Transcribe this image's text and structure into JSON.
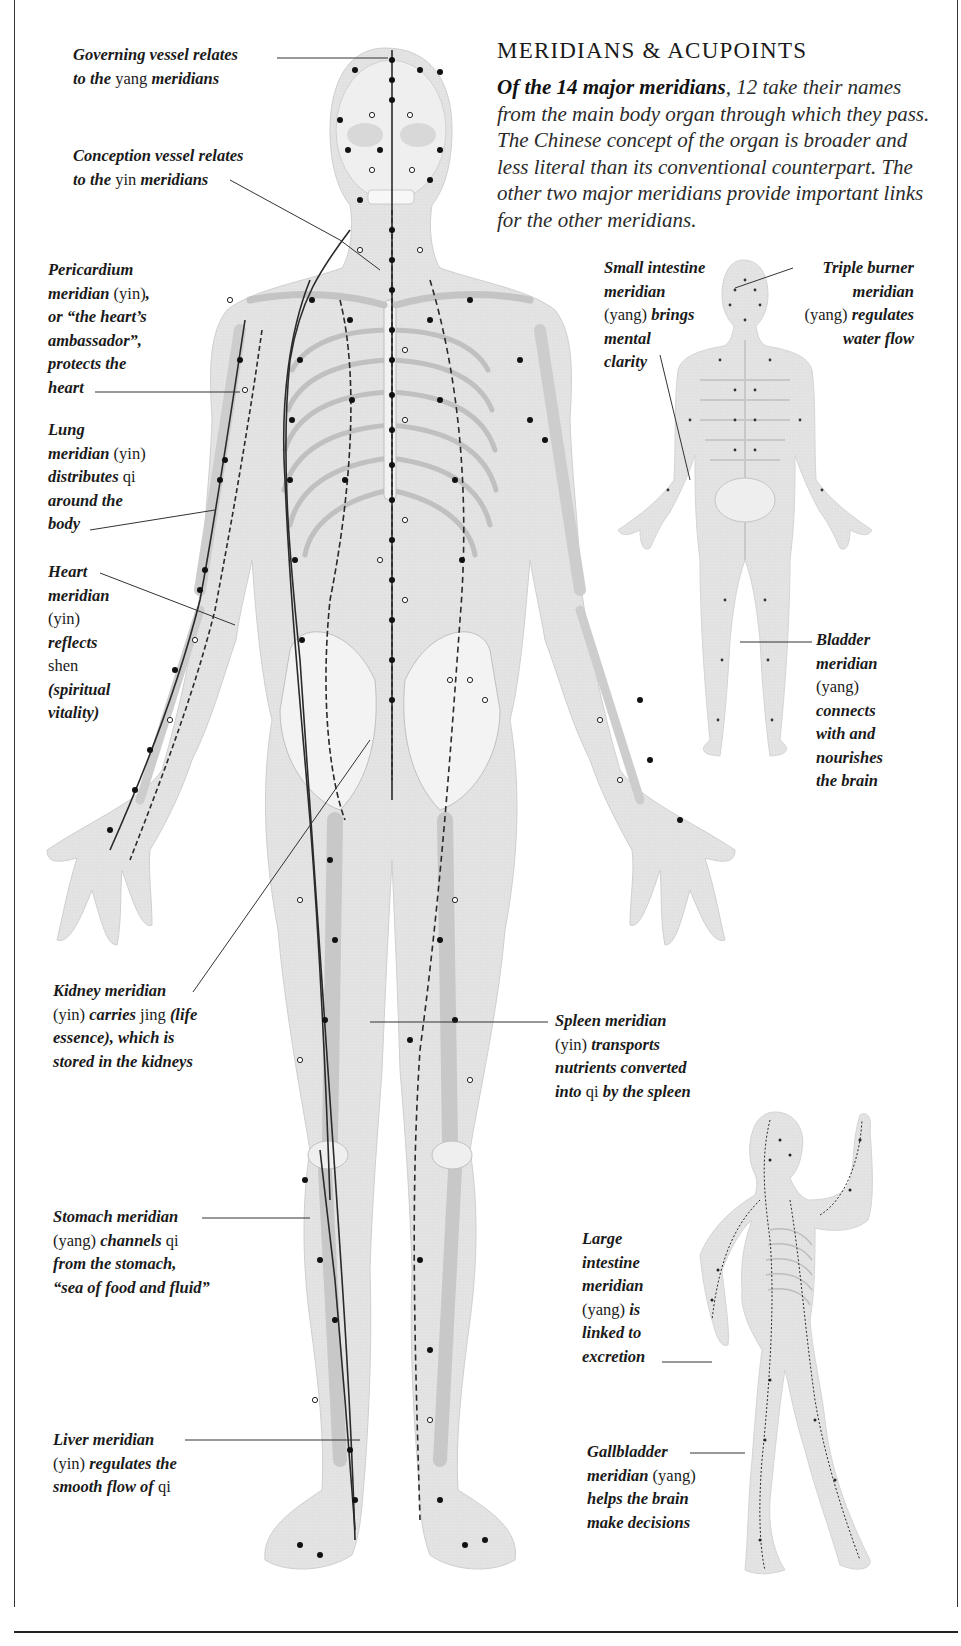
{
  "heading": {
    "title": "MERIDIANS & ACUPOINTS",
    "intro_lead": "Of the 14 major meridians",
    "intro_rest": ", 12 take their names from the main body organ through which they pass. The Chinese concept of the organ is broader and less literal than its conventional counterpart. The other two major meridians provide important links for the other meridians."
  },
  "figures": {
    "main": "front-view-body-with-meridians",
    "back": "back-view-body-with-meridians",
    "side": "side-view-body-with-meridians"
  },
  "labels": {
    "governing": {
      "lines": [
        [
          {
            "t": "Governing vessel relates",
            "s": "i"
          }
        ],
        [
          {
            "t": "to the ",
            "s": "i"
          },
          {
            "t": "yang",
            "s": "n"
          },
          {
            "t": " meridians",
            "s": "i"
          }
        ]
      ]
    },
    "conception": {
      "lines": [
        [
          {
            "t": "Conception vessel relates",
            "s": "i"
          }
        ],
        [
          {
            "t": "to the ",
            "s": "i"
          },
          {
            "t": "yin",
            "s": "n"
          },
          {
            "t": " meridians",
            "s": "i"
          }
        ]
      ]
    },
    "pericardium": {
      "lines": [
        [
          {
            "t": "Pericardium",
            "s": "i"
          }
        ],
        [
          {
            "t": "meridian ",
            "s": "i"
          },
          {
            "t": "(yin)",
            "s": "n"
          },
          {
            "t": ",",
            "s": "i"
          }
        ],
        [
          {
            "t": "or “the heart’s",
            "s": "i"
          }
        ],
        [
          {
            "t": "ambassador”,",
            "s": "i"
          }
        ],
        [
          {
            "t": "protects the",
            "s": "i"
          }
        ],
        [
          {
            "t": "heart",
            "s": "i"
          }
        ]
      ]
    },
    "lung": {
      "lines": [
        [
          {
            "t": "Lung",
            "s": "i"
          }
        ],
        [
          {
            "t": "meridian ",
            "s": "i"
          },
          {
            "t": "(yin)",
            "s": "n"
          }
        ],
        [
          {
            "t": "distributes ",
            "s": "i"
          },
          {
            "t": "qi",
            "s": "n"
          }
        ],
        [
          {
            "t": "around the",
            "s": "i"
          }
        ],
        [
          {
            "t": "body",
            "s": "i"
          }
        ]
      ]
    },
    "heart": {
      "lines": [
        [
          {
            "t": "Heart",
            "s": "i"
          }
        ],
        [
          {
            "t": "meridian",
            "s": "i"
          }
        ],
        [
          {
            "t": "(yin)",
            "s": "n"
          }
        ],
        [
          {
            "t": "reflects",
            "s": "i"
          }
        ],
        [
          {
            "t": "shen",
            "s": "n"
          }
        ],
        [
          {
            "t": "(spiritual",
            "s": "i"
          }
        ],
        [
          {
            "t": "vitality)",
            "s": "i"
          }
        ]
      ]
    },
    "small_intestine": {
      "lines": [
        [
          {
            "t": "Small intestine",
            "s": "i"
          }
        ],
        [
          {
            "t": "meridian",
            "s": "i"
          }
        ],
        [
          {
            "t": "(yang)",
            "s": "n"
          },
          {
            "t": " brings",
            "s": "i"
          }
        ],
        [
          {
            "t": "mental",
            "s": "i"
          }
        ],
        [
          {
            "t": "clarity",
            "s": "i"
          }
        ]
      ]
    },
    "triple_burner": {
      "lines": [
        [
          {
            "t": "Triple burner",
            "s": "i"
          }
        ],
        [
          {
            "t": "meridian",
            "s": "i"
          }
        ],
        [
          {
            "t": "(yang)",
            "s": "n"
          },
          {
            "t": " regulates",
            "s": "i"
          }
        ],
        [
          {
            "t": "water flow",
            "s": "i"
          }
        ]
      ]
    },
    "bladder": {
      "lines": [
        [
          {
            "t": "Bladder",
            "s": "i"
          }
        ],
        [
          {
            "t": "meridian",
            "s": "i"
          }
        ],
        [
          {
            "t": "(yang)",
            "s": "n"
          }
        ],
        [
          {
            "t": "connects",
            "s": "i"
          }
        ],
        [
          {
            "t": "with and",
            "s": "i"
          }
        ],
        [
          {
            "t": "nourishes",
            "s": "i"
          }
        ],
        [
          {
            "t": "the brain",
            "s": "i"
          }
        ]
      ]
    },
    "kidney": {
      "lines": [
        [
          {
            "t": "Kidney meridian",
            "s": "i"
          }
        ],
        [
          {
            "t": "(yin)",
            "s": "n"
          },
          {
            "t": " carries ",
            "s": "i"
          },
          {
            "t": "jing",
            "s": "n"
          },
          {
            "t": " (life",
            "s": "i"
          }
        ],
        [
          {
            "t": "essence), which is",
            "s": "i"
          }
        ],
        [
          {
            "t": "stored in the kidneys",
            "s": "i"
          }
        ]
      ]
    },
    "spleen": {
      "lines": [
        [
          {
            "t": "Spleen meridian",
            "s": "i"
          }
        ],
        [
          {
            "t": "(yin)",
            "s": "n"
          },
          {
            "t": " transports",
            "s": "i"
          }
        ],
        [
          {
            "t": "nutrients converted",
            "s": "i"
          }
        ],
        [
          {
            "t": "into ",
            "s": "i"
          },
          {
            "t": "qi",
            "s": "n"
          },
          {
            "t": " by the spleen",
            "s": "i"
          }
        ]
      ]
    },
    "stomach": {
      "lines": [
        [
          {
            "t": "Stomach meridian",
            "s": "i"
          }
        ],
        [
          {
            "t": "(yang)",
            "s": "n"
          },
          {
            "t": " channels ",
            "s": "i"
          },
          {
            "t": "qi",
            "s": "n"
          }
        ],
        [
          {
            "t": "from the stomach,",
            "s": "i"
          }
        ],
        [
          {
            "t": "“sea of food and fluid”",
            "s": "i"
          }
        ]
      ]
    },
    "large_intestine": {
      "lines": [
        [
          {
            "t": "Large",
            "s": "i"
          }
        ],
        [
          {
            "t": "intestine",
            "s": "i"
          }
        ],
        [
          {
            "t": "meridian",
            "s": "i"
          }
        ],
        [
          {
            "t": "(yang)",
            "s": "n"
          },
          {
            "t": " is",
            "s": "i"
          }
        ],
        [
          {
            "t": "linked to",
            "s": "i"
          }
        ],
        [
          {
            "t": "excretion",
            "s": "i"
          }
        ]
      ]
    },
    "liver": {
      "lines": [
        [
          {
            "t": "Liver meridian",
            "s": "i"
          }
        ],
        [
          {
            "t": "(yin)",
            "s": "n"
          },
          {
            "t": " regulates the",
            "s": "i"
          }
        ],
        [
          {
            "t": "smooth flow of ",
            "s": "i"
          },
          {
            "t": "qi",
            "s": "n"
          }
        ]
      ]
    },
    "gallbladder": {
      "lines": [
        [
          {
            "t": "Gallbladder",
            "s": "i"
          }
        ],
        [
          {
            "t": "meridian ",
            "s": "i"
          },
          {
            "t": "(yang)",
            "s": "n"
          }
        ],
        [
          {
            "t": "helps the brain",
            "s": "i"
          }
        ],
        [
          {
            "t": "make decisions",
            "s": "i"
          }
        ]
      ]
    }
  },
  "colors": {
    "body_fill": "#e6e6e6",
    "bone_fill": "#f4f4f4",
    "bone_stroke": "#b5b5b5",
    "meridian_line": "#2a2a2a",
    "acupoint": "#111111",
    "text": "#1a1a1a"
  }
}
